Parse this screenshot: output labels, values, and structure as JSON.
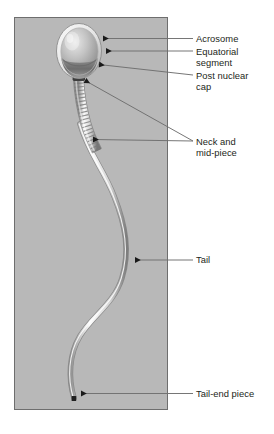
{
  "figure": {
    "panel": {
      "fill": "#b8b8b8",
      "border": "#6e6e6e"
    },
    "caption": ""
  },
  "labels": [
    {
      "id": "acrosome",
      "text": "Acrosome",
      "name": "label-acrosome"
    },
    {
      "id": "equatorial",
      "text": "Equatorial\nsegment",
      "name": "label-equatorial-segment"
    },
    {
      "id": "postnuclear",
      "text": "Post nuclear\ncap",
      "name": "label-post-nuclear-cap"
    },
    {
      "id": "neck",
      "text": "Neck and\nmid-piece",
      "name": "label-neck-and-mid-piece"
    },
    {
      "id": "tail",
      "text": "Tail",
      "name": "label-tail"
    },
    {
      "id": "tailend",
      "text": "Tail-end piece",
      "name": "label-tail-end-piece"
    }
  ],
  "colors": {
    "panel_gray": "#b8b8b8",
    "panel_border": "#6e6e6e",
    "leader_line": "#6f6f6f",
    "arrow_head": "#1a1a1a",
    "text": "#231f20",
    "cell_light": "#f2f2f2",
    "cell_mid": "#9a9a9a",
    "cell_dark": "#4a4a4a"
  }
}
